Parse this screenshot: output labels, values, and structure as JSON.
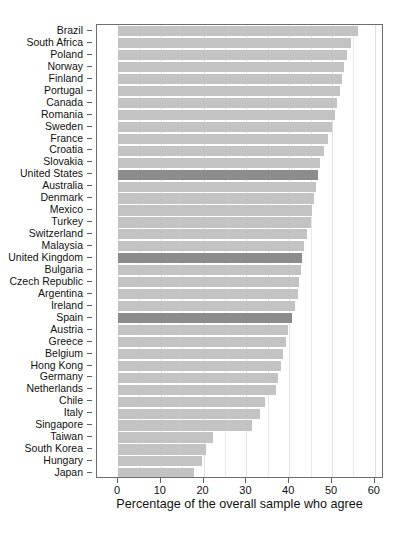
{
  "chart_data": {
    "type": "bar",
    "orientation": "horizontal",
    "title": "",
    "subtitle": "",
    "xlabel": "Percentage of the overall sample who agree",
    "ylabel": "",
    "xlim": [
      0,
      62
    ],
    "xticks": [
      0,
      10,
      20,
      30,
      40,
      50,
      60
    ],
    "xticklabels": [
      "0",
      "10",
      "20",
      "30",
      "40",
      "50",
      "60"
    ],
    "grid": true,
    "legend": "none",
    "categories": [
      "Brazil",
      "South Africa",
      "Poland",
      "Norway",
      "Finland",
      "Portugal",
      "Canada",
      "Romania",
      "Sweden",
      "France",
      "Croatia",
      "Slovakia",
      "United States",
      "Australia",
      "Denmark",
      "Mexico",
      "Turkey",
      "Switzerland",
      "Malaysia",
      "United Kingdom",
      "Bulgaria",
      "Czech Republic",
      "Argentina",
      "Ireland",
      "Spain",
      "Austria",
      "Greece",
      "Belgium",
      "Hong Kong",
      "Germany",
      "Netherlands",
      "Chile",
      "Italy",
      "Singapore",
      "Taiwan",
      "South Korea",
      "Hungary",
      "Japan"
    ],
    "values": [
      56.0,
      54.5,
      53.5,
      52.8,
      52.3,
      51.8,
      51.2,
      50.6,
      50.0,
      49.0,
      48.2,
      47.3,
      46.8,
      46.2,
      45.8,
      45.4,
      45.0,
      44.2,
      43.4,
      43.0,
      42.8,
      42.3,
      42.0,
      41.3,
      40.6,
      39.7,
      39.2,
      38.6,
      38.0,
      37.4,
      36.8,
      34.4,
      33.2,
      31.3,
      22.2,
      20.5,
      19.6,
      17.8
    ],
    "highlighted": [
      "United States",
      "United Kingdom",
      "Spain"
    ],
    "bar_color": "#c3c3c3",
    "highlight_color": "#8c8c8c",
    "panel_border_color": "#6e6e6e",
    "grid_color": "#e9e9e9"
  }
}
